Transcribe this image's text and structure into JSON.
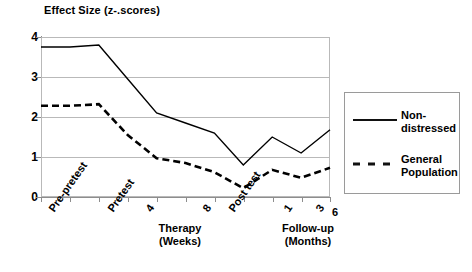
{
  "chart_data": {
    "type": "line",
    "title": "Effect Size (z-.scores)",
    "xlabel": "",
    "ylabel": "",
    "ylim": [
      0,
      4
    ],
    "yticks": [
      "0",
      "1",
      "2",
      "3",
      "4"
    ],
    "grid": true,
    "legend_position": "right",
    "categories": [
      "Pre-pretest",
      "Pretest",
      "4",
      "8",
      "Post test",
      "1",
      "3",
      "6"
    ],
    "x_axis_groups": [
      {
        "label": "Therapy",
        "sublabel": "(Weeks)",
        "ticks": [
          "4",
          "8"
        ]
      },
      {
        "label": "Follow-up",
        "sublabel": "(Months)",
        "ticks": [
          "1",
          "3",
          "6"
        ]
      }
    ],
    "x_tick_labels": [
      {
        "text": "Pre-pretest",
        "rotated": true
      },
      {
        "text": "Pretest",
        "rotated": true
      },
      {
        "text": "4",
        "rotated": true
      },
      {
        "text": "8",
        "rotated": true
      },
      {
        "text": "Post test",
        "rotated": true
      },
      {
        "text": "1",
        "rotated": true
      },
      {
        "text": "3",
        "rotated": true
      },
      {
        "text": "6",
        "rotated": false
      }
    ],
    "series": [
      {
        "name": "Non-distressed",
        "style": "solid",
        "color": "#000000",
        "x": [
          0,
          1,
          2,
          3,
          4,
          5,
          6,
          7,
          8,
          9,
          10
        ],
        "values": [
          3.75,
          3.75,
          3.8,
          2.95,
          2.1,
          1.85,
          1.6,
          0.8,
          1.5,
          1.1,
          1.68
        ]
      },
      {
        "name": "General Population",
        "style": "dashed",
        "color": "#000000",
        "x": [
          0,
          1,
          2,
          3,
          4,
          5,
          6,
          7,
          8,
          9,
          10
        ],
        "values": [
          2.28,
          2.28,
          2.32,
          1.55,
          0.97,
          0.85,
          0.62,
          0.22,
          0.68,
          0.48,
          0.73
        ]
      }
    ]
  },
  "legend": {
    "entries": [
      {
        "label": "Non-distressed",
        "style": "solid"
      },
      {
        "label": "General Population",
        "style": "dashed"
      }
    ]
  }
}
